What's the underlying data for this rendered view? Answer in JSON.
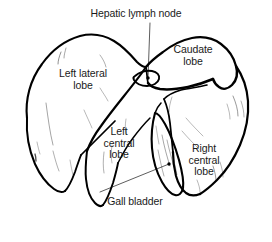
{
  "figure": {
    "kind": "anatomical-line-drawing",
    "background_color": "#ffffff",
    "ink_color": "#000000",
    "text_color": "#1a1a1a",
    "width": 272,
    "height": 242
  },
  "labels": {
    "hepatic_lymph_node": "Hepatic lymph node",
    "caudate_lobe": "Caudate\nlobe",
    "left_lateral_lobe": "Left lateral\nlobe",
    "left_central_lobe": "Left\ncentral\nlobe",
    "right_central_lobe": "Right\ncentral\nlobe",
    "gall_bladder": "Gall bladder"
  },
  "structures": [
    {
      "name": "left-lateral-lobe",
      "label": "Left lateral lobe"
    },
    {
      "name": "caudate-lobe",
      "label": "Caudate lobe"
    },
    {
      "name": "left-central-lobe",
      "label": "Left central lobe"
    },
    {
      "name": "right-central-lobe",
      "label": "Right central lobe"
    },
    {
      "name": "gall-bladder",
      "label": "Gall bladder"
    },
    {
      "name": "hepatic-lymph-node",
      "label": "Hepatic lymph node"
    }
  ],
  "leader_lines": [
    {
      "name": "hepatic-lymph-node-leader",
      "from_label": "Hepatic lymph node",
      "to_structure": "hepatic-lymph-node"
    },
    {
      "name": "gall-bladder-leader",
      "from_label": "Gall bladder",
      "to_structure": "gall-bladder"
    }
  ]
}
